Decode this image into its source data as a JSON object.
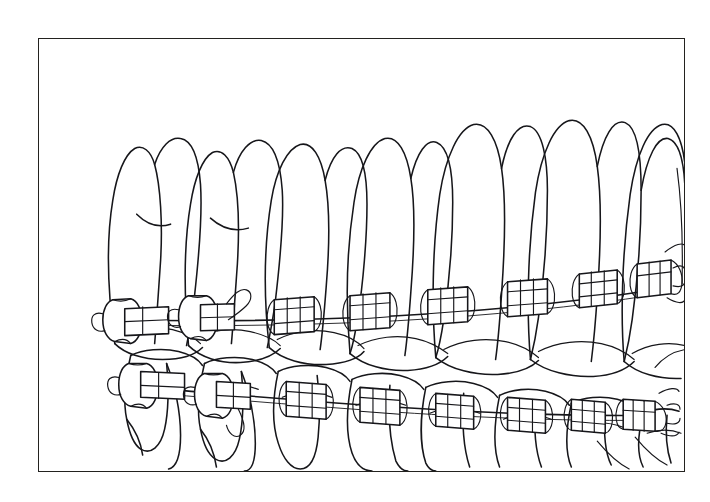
{
  "document": {
    "kind": "line-art-illustration",
    "subject": "Upper and lower dental arches fitted with fixed orthodontic appliances",
    "background_color": "#ffffff",
    "ink_color": "#16161a"
  },
  "caption_fragment": {
    "note": "Caption text clipped at the left edge of the page; only descender glyph remnants are visible",
    "line1": "g",
    "line2": "t"
  },
  "plate": {
    "frame": {
      "border_color": "#23221f",
      "border_width_px": 1.4,
      "left_px": 38,
      "top_px": 38,
      "width_px": 647,
      "height_px": 434,
      "fill": "#ffffff"
    },
    "illustration": {
      "title": "",
      "view": "right lateral oblique",
      "arches": [
        {
          "name": "upper-arch",
          "position": "maxillary",
          "teeth_visible": 10,
          "roots_shown": true,
          "brackets": 8,
          "molar_bands": 2,
          "archwire": "continuous"
        },
        {
          "name": "lower-arch",
          "position": "mandibular",
          "teeth_visible": 10,
          "roots_shown": true,
          "brackets": 8,
          "molar_bands": 2,
          "archwire": "continuous"
        }
      ],
      "appliance_components": [
        "molar band",
        "buccal tube",
        "twin bracket",
        "archwire",
        "ligature wire"
      ]
    }
  }
}
